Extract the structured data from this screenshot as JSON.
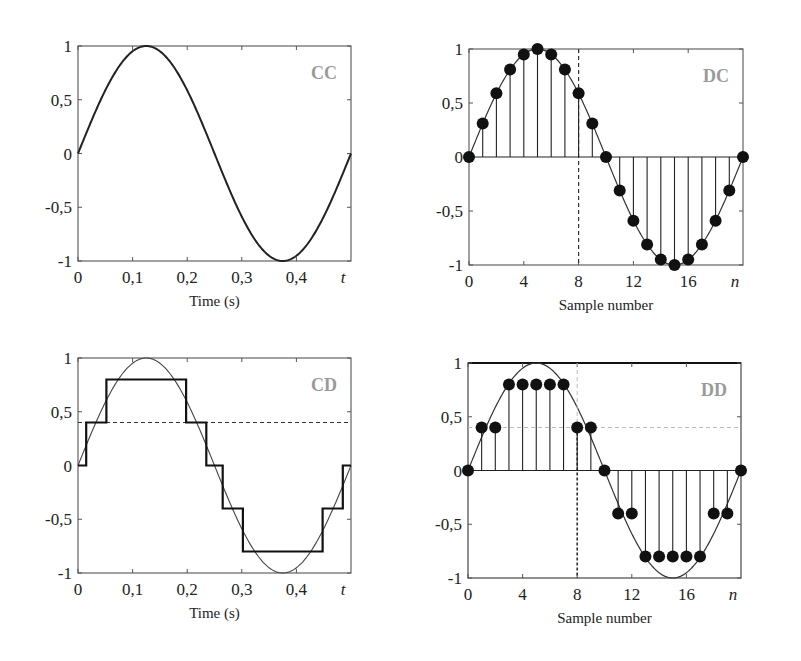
{
  "chart_data": [
    {
      "id": "CC",
      "type": "line",
      "corner_label": "CC",
      "xlabel": "Time (s)",
      "x_axis_symbol": "t",
      "xlim": [
        0,
        0.5
      ],
      "ylim": [
        -1,
        1
      ],
      "xticks": [
        "0",
        "0,1",
        "0,2",
        "0,3",
        "0,4"
      ],
      "yticks": [
        "1",
        "0,5",
        "0",
        "-0,5",
        "-1"
      ],
      "series": [
        {
          "name": "continuous sine",
          "function": "sin(2*pi*2*t)",
          "period": 0.5
        }
      ]
    },
    {
      "id": "DC",
      "type": "stem",
      "corner_label": "DC",
      "xlabel": "Sample number",
      "x_axis_symbol": "n",
      "xlim": [
        0,
        20
      ],
      "ylim": [
        -1,
        1
      ],
      "xticks": [
        "0",
        "4",
        "8",
        "12",
        "16"
      ],
      "yticks": [
        "1",
        "0,5",
        "0",
        "-0,5",
        "-1"
      ],
      "n": [
        0,
        1,
        2,
        3,
        4,
        5,
        6,
        7,
        8,
        9,
        10,
        11,
        12,
        13,
        14,
        15,
        16,
        17,
        18,
        19,
        20
      ],
      "values": [
        0,
        0.31,
        0.59,
        0.81,
        0.95,
        1.0,
        0.95,
        0.81,
        0.59,
        0.31,
        0,
        -0.31,
        -0.59,
        -0.81,
        -0.95,
        -1.0,
        -0.95,
        -0.81,
        -0.59,
        -0.31,
        0
      ],
      "marker_line": {
        "type": "vertical-dashed",
        "x": 8
      }
    },
    {
      "id": "CD",
      "type": "step",
      "corner_label": "CD",
      "xlabel": "Time (s)",
      "x_axis_symbol": "t",
      "xlim": [
        0,
        0.5
      ],
      "ylim": [
        -1,
        1
      ],
      "xticks": [
        "0",
        "0,1",
        "0,2",
        "0,3",
        "0,4"
      ],
      "yticks": [
        "1",
        "0,5",
        "0",
        "-0,5",
        "-1"
      ],
      "levels": [
        -0.8,
        -0.4,
        0,
        0.4,
        0.8
      ],
      "steps": [
        {
          "t0": 0,
          "t1": 0.015,
          "v": 0
        },
        {
          "t0": 0.015,
          "t1": 0.052,
          "v": 0.4
        },
        {
          "t0": 0.052,
          "t1": 0.198,
          "v": 0.8
        },
        {
          "t0": 0.198,
          "t1": 0.235,
          "v": 0.4
        },
        {
          "t0": 0.235,
          "t1": 0.265,
          "v": 0
        },
        {
          "t0": 0.265,
          "t1": 0.302,
          "v": -0.4
        },
        {
          "t0": 0.302,
          "t1": 0.448,
          "v": -0.8
        },
        {
          "t0": 0.448,
          "t1": 0.485,
          "v": -0.4
        },
        {
          "t0": 0.485,
          "t1": 0.5,
          "v": 0
        }
      ],
      "reference_curve": "sin(2*pi*2*t)",
      "marker_line": {
        "type": "horizontal-dashed",
        "y": 0.4
      }
    },
    {
      "id": "DD",
      "type": "stem",
      "corner_label": "DD",
      "xlabel": "Sample number",
      "x_axis_symbol": "n",
      "xlim": [
        0,
        20
      ],
      "ylim": [
        -1,
        1
      ],
      "xticks": [
        "0",
        "4",
        "8",
        "12",
        "16"
      ],
      "yticks": [
        "1",
        "0,5",
        "0",
        "-0,5",
        "-1"
      ],
      "n": [
        0,
        1,
        2,
        3,
        4,
        5,
        6,
        7,
        8,
        9,
        10,
        11,
        12,
        13,
        14,
        15,
        16,
        17,
        18,
        19,
        20
      ],
      "values": [
        0,
        0.4,
        0.4,
        0.8,
        0.8,
        0.8,
        0.8,
        0.8,
        0.4,
        0.4,
        0,
        -0.4,
        -0.4,
        -0.8,
        -0.8,
        -0.8,
        -0.8,
        -0.8,
        -0.4,
        -0.4,
        0
      ],
      "reference_curve": "sin",
      "marker_lines": [
        {
          "type": "vertical-dashed",
          "x": 8
        },
        {
          "type": "horizontal-dashed",
          "y": 0.4
        }
      ]
    }
  ],
  "panels": {
    "cc": {
      "label": "CC",
      "xlabel": "Time (s)",
      "xsym": "t"
    },
    "dc": {
      "label": "DC",
      "xlabel": "Sample number",
      "xsym": "n"
    },
    "cd": {
      "label": "CD",
      "xlabel": "Time (s)",
      "xsym": "t"
    },
    "dd": {
      "label": "DD",
      "xlabel": "Sample number",
      "xsym": "n"
    }
  },
  "colors": {
    "axis": "#555555",
    "curve": "#222222",
    "label_gray": "#9a9a9a",
    "dash": "#333333",
    "dash_light": "#bbbbbb"
  }
}
